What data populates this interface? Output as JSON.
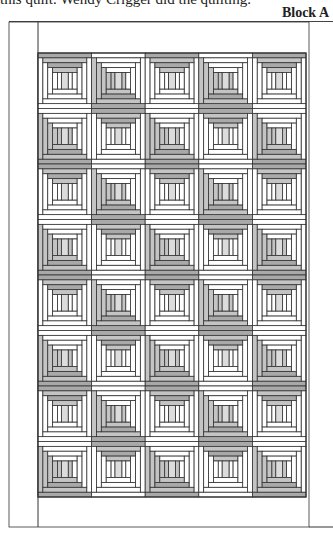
{
  "caption": "this quilt. Wendy Crigger did the quilting.",
  "label": "Block A",
  "colors": {
    "line": "#333333",
    "dark": "#a9a9a9",
    "mid": "#c4c4c4",
    "light": "#dcdcdc",
    "white": "#ffffff"
  },
  "quilt": {
    "frame": {
      "x": 9,
      "y": 22,
      "w": 300,
      "h": 505
    },
    "inner_left_x": 38,
    "blocks_area": {
      "x": 38,
      "y": 53,
      "w": 268,
      "h": 444
    },
    "columns": 5,
    "rows": 8,
    "layout": [
      [
        "A",
        "B",
        "A",
        "B",
        "A"
      ],
      [
        "B",
        "A",
        "B",
        "A",
        "B"
      ],
      [
        "A",
        "B",
        "A",
        "B",
        "A"
      ],
      [
        "B",
        "A",
        "B",
        "A",
        "B"
      ],
      [
        "A",
        "B",
        "A",
        "B",
        "A"
      ],
      [
        "B",
        "A",
        "B",
        "A",
        "B"
      ],
      [
        "A",
        "B",
        "A",
        "B",
        "A"
      ],
      [
        "B",
        "A",
        "B",
        "A",
        "B"
      ]
    ]
  },
  "block_types": {
    "A": {
      "rings": [
        {
          "top": "dark",
          "right": "white",
          "bottom": "white",
          "left": "white"
        },
        {
          "top": "mid",
          "right": "white",
          "bottom": "white",
          "left": "white"
        },
        {
          "top": "dark",
          "right": "white",
          "bottom": "white",
          "left": "white"
        },
        {
          "top": "mid",
          "right": "white",
          "bottom": "white",
          "left": "white"
        }
      ],
      "center": "light",
      "center_sides": "white"
    },
    "B": {
      "rings": [
        {
          "top": "white",
          "right": "white",
          "bottom": "dark",
          "left": "mid"
        },
        {
          "top": "white",
          "right": "white",
          "bottom": "mid",
          "left": "mid"
        },
        {
          "top": "white",
          "right": "white",
          "bottom": "dark",
          "left": "mid"
        },
        {
          "top": "white",
          "right": "white",
          "bottom": "mid",
          "left": "mid"
        }
      ],
      "center": "light",
      "center_sides": "mid"
    }
  }
}
